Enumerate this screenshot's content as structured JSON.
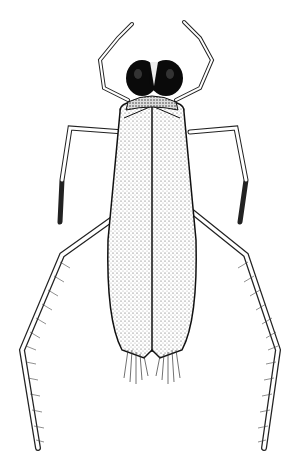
{
  "image": {
    "subject": "water boatman insect illustration",
    "style": "black ink stipple drawing on white",
    "view": "dorsal",
    "colors": {
      "background": "#ffffff",
      "ink": "#111111",
      "eyes": "#0a0a0a"
    },
    "parts": [
      "head",
      "compound-eyes",
      "pronotum",
      "wings",
      "front-legs",
      "middle-legs",
      "hind-legs",
      "hair-fringe"
    ]
  }
}
